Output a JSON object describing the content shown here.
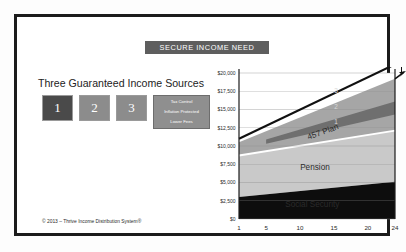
{
  "banner": {
    "label": "SECURE INCOME NEED",
    "color": "#5e5e5e"
  },
  "left_panel": {
    "heading": "Three Guaranteed Income Sources",
    "boxes": [
      {
        "label": "1",
        "color": "#4a4a4a"
      },
      {
        "label": "2",
        "color": "#8c8c8c"
      },
      {
        "label": "3",
        "color": "#8c8c8c"
      }
    ],
    "feature_box": {
      "color": "#8f8f8f",
      "lines": [
        "Tax Control",
        "Inflation Protected",
        "Lower Fees"
      ]
    }
  },
  "footer": {
    "copyright": "© 2013 – Thrive Income Distribution System®"
  },
  "chart_data": {
    "type": "area",
    "title": "SECURE INCOME NEED",
    "xlabel": "",
    "ylabel": "",
    "x": [
      1,
      24
    ],
    "xlim": [
      1,
      24
    ],
    "ylim": [
      0,
      20000
    ],
    "ytick_labels": [
      "$20,000",
      "$17,500",
      "$15,000",
      "$12,500",
      "$10,000",
      "$7,500",
      "$5,000",
      "$2,500",
      "$0"
    ],
    "ytick_values": [
      20000,
      17500,
      15000,
      12500,
      10000,
      7500,
      5000,
      2500,
      0
    ],
    "xtick_labels": [
      "1",
      "5",
      "10",
      "15",
      "20",
      "24"
    ],
    "xtick_values": [
      1,
      5,
      10,
      15,
      20,
      24
    ],
    "grid": true,
    "legend_position": "inline-band-labels",
    "series": [
      {
        "name": "Social Security",
        "color": "#0d0d0d",
        "start_value": 0,
        "end_value": 0,
        "top_start": 3000,
        "top_end": 5100
      },
      {
        "name": "Pension",
        "color": "#c9c9c9",
        "top_start": 8700,
        "top_end": 12100
      },
      {
        "name": "457 Plan",
        "color": "#a6a6a6",
        "top_start": 10500,
        "top_end": 19200
      }
    ],
    "need_line": {
      "name": "Secure Income Need",
      "color": "#111111",
      "start_value": 11000,
      "end_value": 20400
    },
    "markers": [
      {
        "label": "3",
        "x": 15.3,
        "y": 17300
      },
      {
        "label": "2",
        "x": 15.3,
        "y": 15100
      },
      {
        "label": "1",
        "x": 15.3,
        "y": 13000
      }
    ],
    "gap_arrows": 2,
    "band_labels": [
      "457 Plan",
      "Pension",
      "Social Security"
    ]
  }
}
